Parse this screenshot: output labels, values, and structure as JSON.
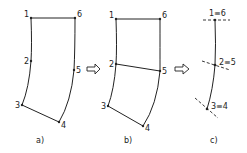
{
  "panels": [
    {
      "id": "a",
      "caption": "a)",
      "nodes": [
        {
          "label": "1",
          "x": 31,
          "y": 18
        },
        {
          "label": "2",
          "x": 31,
          "y": 61
        },
        {
          "label": "3",
          "x": 22,
          "y": 105
        },
        {
          "label": "4",
          "x": 59,
          "y": 122
        },
        {
          "label": "5",
          "x": 74,
          "y": 70
        },
        {
          "label": "6",
          "x": 75,
          "y": 18
        }
      ]
    },
    {
      "id": "b",
      "caption": "b)",
      "nodes": [
        {
          "label": "1",
          "x": 116,
          "y": 19
        },
        {
          "label": "2",
          "x": 116,
          "y": 64
        },
        {
          "label": "3",
          "x": 108,
          "y": 106
        },
        {
          "label": "4",
          "x": 143,
          "y": 126
        },
        {
          "label": "5",
          "x": 160,
          "y": 71
        },
        {
          "label": "6",
          "x": 160,
          "y": 19
        }
      ]
    },
    {
      "id": "c",
      "caption": "c)",
      "nodes": [
        {
          "label": "1≡6",
          "x": 215,
          "y": 20
        },
        {
          "label": "2≡5",
          "x": 215,
          "y": 65
        },
        {
          "label": "3≡4",
          "x": 207,
          "y": 109
        }
      ]
    }
  ],
  "arrows": [
    {
      "from": "a",
      "to": "b"
    },
    {
      "from": "b",
      "to": "c"
    }
  ]
}
